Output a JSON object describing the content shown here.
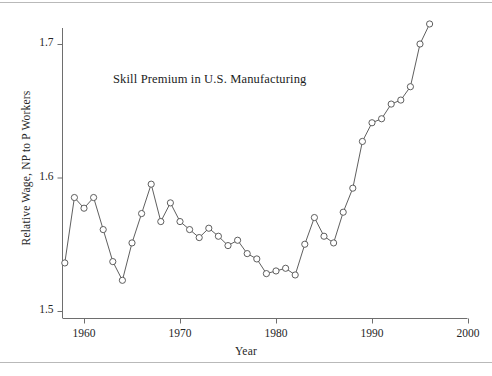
{
  "figure": {
    "title": "Skill Premium in U.S. Manufacturing",
    "xlabel": "Year",
    "ylabel": "Relative Wage, NP to P Workers"
  },
  "axes": {
    "y_ticks": [
      "1.5",
      "1.6",
      "1.7"
    ],
    "x_ticks": [
      "1960",
      "1970",
      "1980",
      "1990",
      "2000"
    ]
  },
  "chart_data": {
    "type": "line",
    "title": "Skill Premium in U.S. Manufacturing",
    "xlabel": "Year",
    "ylabel": "Relative Wage, NP to P Workers",
    "xlim": [
      1957,
      2000
    ],
    "ylim": [
      1.5,
      1.725
    ],
    "xticks": [
      1960,
      1970,
      1980,
      1990,
      2000
    ],
    "yticks": [
      1.5,
      1.6,
      1.7
    ],
    "grid": false,
    "legend": "none",
    "marker": "open-circle",
    "x": [
      1958,
      1959,
      1960,
      1961,
      1962,
      1963,
      1964,
      1965,
      1966,
      1967,
      1968,
      1969,
      1970,
      1971,
      1972,
      1973,
      1974,
      1975,
      1976,
      1977,
      1978,
      1979,
      1980,
      1981,
      1982,
      1983,
      1984,
      1985,
      1986,
      1987,
      1988,
      1989,
      1990,
      1991,
      1992,
      1993,
      1994,
      1995,
      1996
    ],
    "values": [
      1.536,
      1.585,
      1.577,
      1.585,
      1.561,
      1.537,
      1.523,
      1.551,
      1.573,
      1.595,
      1.567,
      1.581,
      1.567,
      1.561,
      1.555,
      1.562,
      1.556,
      1.549,
      1.553,
      1.543,
      1.539,
      1.528,
      1.53,
      1.532,
      1.527,
      1.55,
      1.57,
      1.556,
      1.551,
      1.574,
      1.592,
      1.627,
      1.641,
      1.644,
      1.655,
      1.658,
      1.668,
      1.7,
      1.715
    ]
  }
}
